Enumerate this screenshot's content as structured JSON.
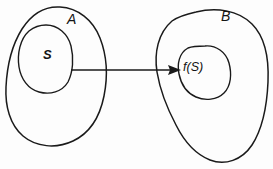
{
  "figure": {
    "name": "set-mapping-diagram",
    "background_color": "#fdfdfd",
    "stroke_color": "#1a1a1a",
    "width": 273,
    "height": 169
  },
  "labels": {
    "domain_set": "A",
    "codomain_set": "B",
    "subset": "S",
    "image_subset": "f(S)"
  },
  "shapes": {
    "domain_blob": {
      "name": "blob-A",
      "label": "A"
    },
    "codomain_blob": {
      "name": "blob-B",
      "label": "B"
    },
    "subset_blob": {
      "name": "blob-S",
      "label": "S"
    },
    "image_blob": {
      "name": "blob-fS",
      "label": "f(S)"
    }
  },
  "arrow": {
    "name": "mapping-arrow",
    "from": "S",
    "to": "f(S)",
    "direction": "left-to-right"
  }
}
